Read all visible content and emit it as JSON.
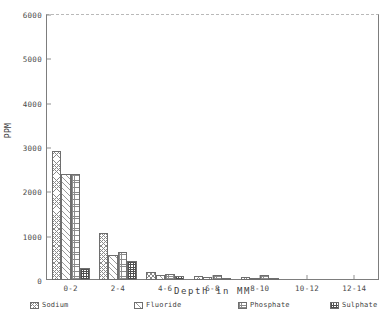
{
  "chart_data": {
    "type": "bar",
    "title": "",
    "xlabel": "Depth in MM",
    "ylabel": "PPM",
    "categories": [
      "0-2",
      "2-4",
      "4-6",
      "6-8",
      "8-10",
      "10-12",
      "12-14"
    ],
    "ylim": [
      0,
      6000
    ],
    "ytick_values": [
      0,
      1000,
      2000,
      3000,
      4000,
      5000,
      6000
    ],
    "ytick_labels": [
      "0",
      "1000",
      "2000",
      "3000",
      "4000",
      "5000",
      "6000"
    ],
    "grid": false,
    "legend_position": "below",
    "series": [
      {
        "name": "Sodium",
        "pattern": "crosshatch-diagonal",
        "values": [
          2900,
          1050,
          180,
          90,
          70,
          0,
          0
        ]
      },
      {
        "name": "Fluoride",
        "pattern": "diagonal-lines",
        "values": [
          2400,
          560,
          110,
          60,
          40,
          0,
          0
        ]
      },
      {
        "name": "Phosphate",
        "pattern": "fine-grid",
        "values": [
          2400,
          640,
          140,
          120,
          110,
          0,
          0
        ]
      },
      {
        "name": "Sulphate",
        "pattern": "dense-dark-grid",
        "values": [
          260,
          430,
          100,
          50,
          30,
          0,
          0
        ]
      }
    ]
  },
  "legend": {
    "items": [
      {
        "label": "Sodium"
      },
      {
        "label": "Fluoride"
      },
      {
        "label": "Phosphate"
      },
      {
        "label": "Sulphate"
      }
    ]
  }
}
